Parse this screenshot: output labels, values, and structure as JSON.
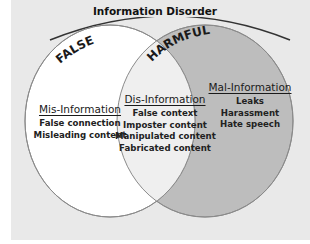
{
  "title": "Information Disorder",
  "sets": {
    "false": {
      "label": "FALSE",
      "fill": "#ffffff"
    },
    "harmful": {
      "label": "HARMFUL",
      "fill": "#bdbdbd"
    },
    "overlap_fill": "#efefef"
  },
  "groups": [
    {
      "heading": "Mis-Information",
      "items": [
        "False connection",
        "Misleading content"
      ]
    },
    {
      "heading": "Dis-Information",
      "items": [
        "False context",
        "Imposter content",
        "Manipulated content",
        "Fabricated content"
      ]
    },
    {
      "heading": "Mal-Information",
      "items": [
        "Leaks",
        "Harassment",
        "Hate speech"
      ]
    }
  ],
  "colors": {
    "background": "#e9e9e9",
    "outline": "#8a8a8a",
    "arc": "#333333"
  }
}
